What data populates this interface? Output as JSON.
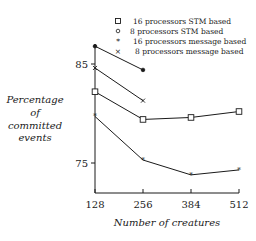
{
  "chart_data": {
    "type": "line",
    "title": "",
    "xlabel": "Number of creatures",
    "ylabel_lines": [
      "Percentage",
      "of",
      "committed",
      "events"
    ],
    "ylabel": "Percentage of committed events",
    "x": [
      128,
      256,
      384,
      512
    ],
    "x_tick_labels": [
      "128",
      "256",
      "384",
      "512"
    ],
    "y_tick_labels": [
      "85",
      "75"
    ],
    "y_ticks": [
      85,
      75
    ],
    "ylim": [
      71.9,
      88.6
    ],
    "grid": false,
    "legend_position": "top-right",
    "series": [
      {
        "name": "16 processors STM based",
        "marker": "square",
        "x": [
          128,
          256,
          384,
          512
        ],
        "values": [
          82.2,
          79.4,
          79.6,
          80.2
        ]
      },
      {
        "name": "8 processors STM based",
        "marker": "circle",
        "x": [
          128,
          256
        ],
        "values": [
          86.8,
          84.4
        ]
      },
      {
        "name": "16 processors message based",
        "marker": "star",
        "x": [
          128,
          256,
          384,
          512
        ],
        "values": [
          79.7,
          75.3,
          73.8,
          74.3
        ]
      },
      {
        "name": "8 processors message based",
        "marker": "cross",
        "x": [
          128,
          256
        ],
        "values": [
          84.6,
          81.3
        ]
      }
    ]
  },
  "legend": {
    "items": [
      {
        "symbol": "□",
        "label": "16 processors STM based"
      },
      {
        "symbol": "o",
        "label": "8 processors STM based"
      },
      {
        "symbol": "*",
        "label": "16 processors message based"
      },
      {
        "symbol": "×",
        "label": "8 processors message based"
      }
    ]
  }
}
